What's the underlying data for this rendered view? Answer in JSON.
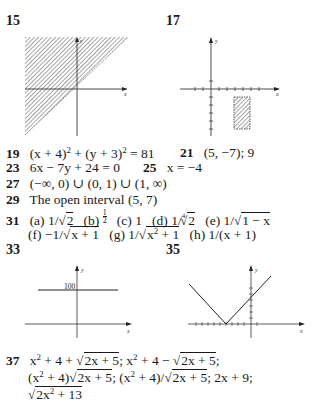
{
  "problems": {
    "p15": {
      "number": "15",
      "graph": "shaded-region-above-line-y-equals-x",
      "axis_labels": {
        "x": "x",
        "y": "y"
      }
    },
    "p17": {
      "number": "17",
      "graph": "shaded-rectangle-in-fourth-quadrant",
      "axis_labels": {
        "x": "x",
        "y": "y"
      }
    },
    "p19": {
      "number": "19",
      "parts": [
        "(x + 4)",
        "2",
        " + (y + 3)",
        "2",
        " = 81"
      ]
    },
    "p21": {
      "number": "21",
      "text": "(5, −7); 9"
    },
    "p23": {
      "number": "23",
      "text": "6x − 7y + 24 = 0"
    },
    "p25": {
      "number": "25",
      "text": "x = −4"
    },
    "p27": {
      "number": "27",
      "text": "(−∞, 0) ∪ (0, 1) ∪ (1, ∞)"
    },
    "p29": {
      "number": "29",
      "text": "The open interval (5, 7)"
    },
    "p31": {
      "number": "31",
      "a": {
        "label": "(a)",
        "prefix": "1/",
        "radicand": "2"
      },
      "b": {
        "label": "(b)",
        "num": "1",
        "den": "2"
      },
      "c": {
        "label": "(c)",
        "text": "1"
      },
      "d": {
        "label": "(d)",
        "prefix": "1/",
        "index": "4",
        "radicand": "2"
      },
      "e": {
        "label": "(e)",
        "prefix": "1/",
        "radicand": "1 − x"
      },
      "f": {
        "label": "(f)",
        "prefix": "−1/",
        "radicand": "x + 1"
      },
      "g": {
        "label": "(g)",
        "prefix": "1/",
        "radicand_a": "x",
        "radicand_exp": "2",
        "radicand_b": " + 1"
      },
      "h": {
        "label": "(h)",
        "text": "1/(x + 1)"
      }
    },
    "p33": {
      "number": "33",
      "graph": "horizontal-line-y-equals-100",
      "y_value_label": "100",
      "axis_labels": {
        "x": "x",
        "y": "y"
      }
    },
    "p35": {
      "number": "35",
      "graph": "absolute-value-v-shape",
      "axis_labels": {
        "x": "x",
        "y": "y"
      }
    },
    "p37": {
      "number": "37",
      "line1": {
        "a": "x",
        "a_exp": "2",
        "b": " + 4 + ",
        "rad1": "2x + 5",
        "c": "; x",
        "c_exp": "2",
        "d": " + 4 − ",
        "rad2": "2x + 5",
        "e": ";"
      },
      "line2": {
        "a": "(x",
        "a_exp": "2",
        "b": " + 4)",
        "rad1": "2x + 5",
        "c": "; (x",
        "c_exp": "2",
        "d": " + 4)/",
        "rad2": "2x + 5",
        "e": "; 2x + 9;"
      },
      "line3": {
        "rad_a": "2x",
        "rad_exp": "2",
        "rad_b": " + 13"
      }
    }
  }
}
